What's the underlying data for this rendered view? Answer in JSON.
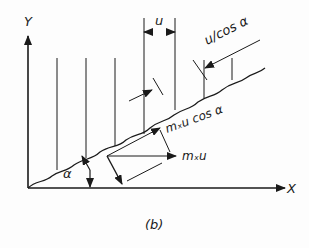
{
  "figure": {
    "caption": "(b)",
    "axes": {
      "x_label": "X",
      "y_label": "Y"
    },
    "labels": {
      "spacing": "u",
      "slant_spacing": "u/cos α",
      "surface_component": "mₓu cos α",
      "horizontal_component": "mₓu",
      "angle": "α"
    },
    "colors": {
      "ink": "#1a1a1a",
      "background": "#fdfdfd"
    }
  }
}
